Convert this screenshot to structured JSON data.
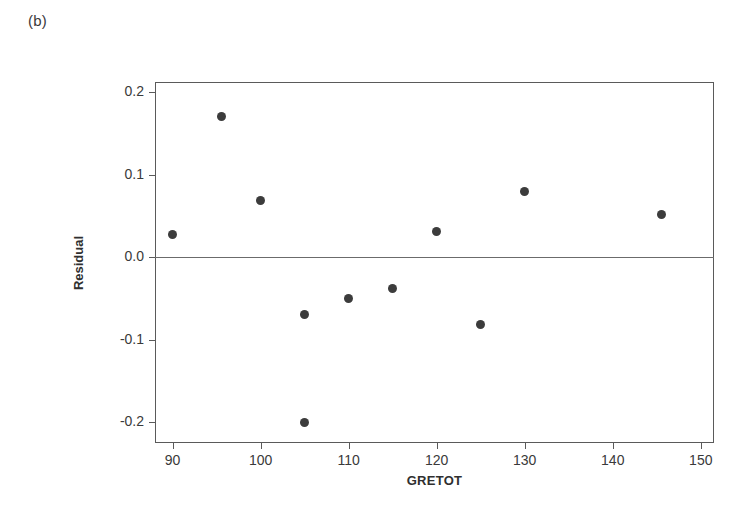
{
  "panel": {
    "label": "(b)"
  },
  "chart_data": {
    "type": "scatter",
    "title": "",
    "subtitle": "",
    "xlabel": "GRETOT",
    "ylabel": "Residual",
    "xlim": [
      88.0,
      151.5
    ],
    "ylim": [
      -0.225,
      0.212
    ],
    "xticks": [
      90,
      100,
      110,
      120,
      130,
      140,
      150
    ],
    "xtick_labels": [
      "90",
      "100",
      "110",
      "120",
      "130",
      "140",
      "150"
    ],
    "yticks": [
      0.2,
      0.1,
      0.0,
      -0.1,
      -0.2
    ],
    "ytick_labels": [
      "0.2",
      "0.1",
      "0.0",
      "-0.1",
      "-0.2"
    ],
    "grid": false,
    "legend": null,
    "reference_lines": [
      {
        "orientation": "horizontal",
        "value": 0.0,
        "name": "zero-residual-line"
      }
    ],
    "marker": {
      "shape": "circle",
      "color": "#3c3c3c",
      "size_px": 9
    },
    "points": [
      {
        "x": 90.0,
        "y": 0.028
      },
      {
        "x": 95.5,
        "y": 0.17
      },
      {
        "x": 100.0,
        "y": 0.068
      },
      {
        "x": 105.0,
        "y": -0.07
      },
      {
        "x": 105.0,
        "y": -0.2
      },
      {
        "x": 110.0,
        "y": -0.05
      },
      {
        "x": 115.0,
        "y": -0.038
      },
      {
        "x": 120.0,
        "y": 0.031
      },
      {
        "x": 125.0,
        "y": -0.082
      },
      {
        "x": 130.0,
        "y": 0.08
      },
      {
        "x": 145.5,
        "y": 0.052
      }
    ],
    "colors": {
      "marker": "#3c3c3c",
      "axis": "#5a5a5a",
      "zero_line": "#6b6b6b",
      "text": "#3a3a3a",
      "background": "#ffffff"
    }
  }
}
